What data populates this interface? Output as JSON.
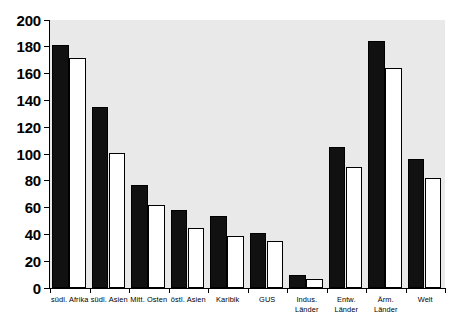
{
  "chart_data": {
    "type": "bar",
    "title": "",
    "subtitle": "",
    "xlabel": "",
    "ylabel": "",
    "ylim": [
      0,
      200
    ],
    "ytick_step": 20,
    "yticks": [
      200,
      180,
      160,
      140,
      120,
      100,
      80,
      60,
      40,
      20,
      0
    ],
    "grid": false,
    "legend": false,
    "legend_position": "none",
    "categories": [
      "südl. Afrika",
      "südl. Asien",
      "Mitt. Osten",
      "östl. Asien",
      "Karibik",
      "GUS",
      "Indus.\nLänder",
      "Entw.\nLänder",
      "Ärm. Länder",
      "Welt"
    ],
    "series": [
      {
        "name": "series-dark",
        "color": "#111111",
        "values": [
          181,
          135,
          77,
          58,
          54,
          41,
          10,
          105,
          184,
          96
        ]
      },
      {
        "name": "series-light",
        "color": "#ffffff",
        "values": [
          172,
          101,
          62,
          45,
          39,
          35,
          7,
          90,
          164,
          82
        ]
      }
    ],
    "colors": {
      "plot_background": "#e9e9e9",
      "page_background": "#ffffff",
      "axis": "#000000",
      "bar_dark": "#111111",
      "bar_light": "#ffffff"
    }
  }
}
